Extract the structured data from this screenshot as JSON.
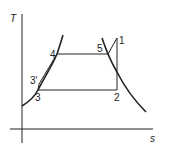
{
  "diagram": {
    "type": "T-s diagram",
    "axes": {
      "y_label": "T",
      "x_label": "s"
    },
    "points": [
      {
        "id": "1",
        "label": "1"
      },
      {
        "id": "2",
        "label": "2"
      },
      {
        "id": "3",
        "label": "3"
      },
      {
        "id": "3p",
        "label": "3′"
      },
      {
        "id": "4",
        "label": "4"
      },
      {
        "id": "5",
        "label": "5"
      }
    ],
    "colors": {
      "line": "#222222",
      "background": "#ffffff"
    }
  }
}
